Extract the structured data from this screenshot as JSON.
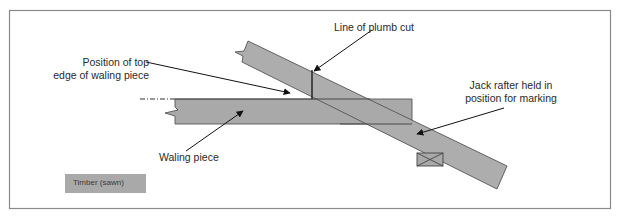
{
  "diagram": {
    "labels": {
      "top_edge": [
        "Position of top",
        "edge of waling piece"
      ],
      "plumb_cut": "Line of plumb cut",
      "jack_rafter": [
        "Jack rafter held in",
        "position for marking"
      ],
      "waling_piece": "Waling piece"
    },
    "legend": {
      "items": [
        {
          "label": "Timber (sawn)",
          "color": "#a9a9a9"
        }
      ]
    },
    "colors": {
      "timber": "#a9a9a9",
      "outline": "#555555",
      "frame": "#8a8a8a",
      "line": "#111111"
    }
  }
}
